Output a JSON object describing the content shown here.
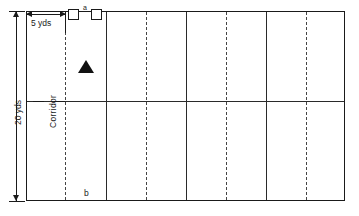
{
  "diagram": {
    "labels": {
      "corridor": "Corridor",
      "width_dim": "5 yds",
      "height_dim": "20 yds",
      "marker_a": "a",
      "marker_b": "b"
    },
    "colors": {
      "line": "#1a1a1a",
      "dashed_line": "#444444",
      "marker_fill": "#111111",
      "background": "#ffffff"
    },
    "field": {
      "left_px": 26,
      "top_px": 11,
      "width_px": 319,
      "height_px": 190,
      "vertical_lines": [
        {
          "x_px": 65,
          "style": "dashed"
        },
        {
          "x_px": 106,
          "style": "solid"
        },
        {
          "x_px": 146,
          "style": "dashed"
        },
        {
          "x_px": 186,
          "style": "solid"
        },
        {
          "x_px": 226,
          "style": "dashed"
        },
        {
          "x_px": 266,
          "style": "solid"
        },
        {
          "x_px": 306,
          "style": "dashed"
        }
      ],
      "horizontal_lines": [
        {
          "y_px": 101,
          "style": "solid"
        }
      ]
    },
    "markers": [
      {
        "name": "square-left",
        "shape": "square",
        "x_px": 68,
        "y_px": 11
      },
      {
        "name": "square-right",
        "shape": "square",
        "x_px": 90,
        "y_px": 11
      },
      {
        "name": "triangle",
        "shape": "triangle",
        "x_px": 86,
        "y_px": 72
      }
    ]
  }
}
